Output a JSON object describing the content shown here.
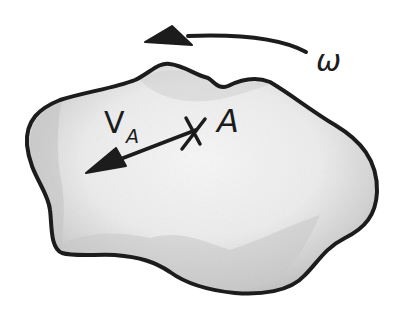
{
  "diagram": {
    "kind": "rigid body kinematics sketch",
    "colors": {
      "ink": "#1c1c1c",
      "body_fill_light": "#f4f4f4",
      "body_fill_mid": "#dcdcdc",
      "body_fill_dark": "#bdbdbd",
      "background": "#ffffff"
    },
    "body": {
      "name": "rigid-body-blob",
      "outline_path": "M 27 145 C 25 120, 40 108, 60 100 C 85 92, 115 88, 135 80 C 150 73, 158 62, 170 64 C 185 66, 195 75, 208 78 C 215 82, 218 90, 228 86 C 240 80, 255 76, 270 82 C 292 95, 310 110, 335 125 C 360 140, 378 160, 377 192 C 376 215, 365 228, 345 238 C 325 248, 318 262, 305 275 C 290 292, 260 295, 235 293 C 205 290, 185 283, 170 272 C 155 262, 140 257, 115 255 C 95 254, 75 257, 62 253 C 50 248, 52 225, 50 210 C 48 190, 30 175, 27 145 Z"
    },
    "rotation": {
      "label": "ω",
      "arc_path": "M 306 52 C 280 38, 240 34, 188 36",
      "arrowhead_points": "145,42 172,26 192,45"
    },
    "point": {
      "label": "A",
      "marker": "×",
      "position": [
        193,
        133
      ]
    },
    "velocity": {
      "label_main": "V",
      "label_sub": "A",
      "shaft_path": "M 196 130 L 118 160",
      "arrowhead_points": "86,173 116,148 126,166"
    }
  }
}
